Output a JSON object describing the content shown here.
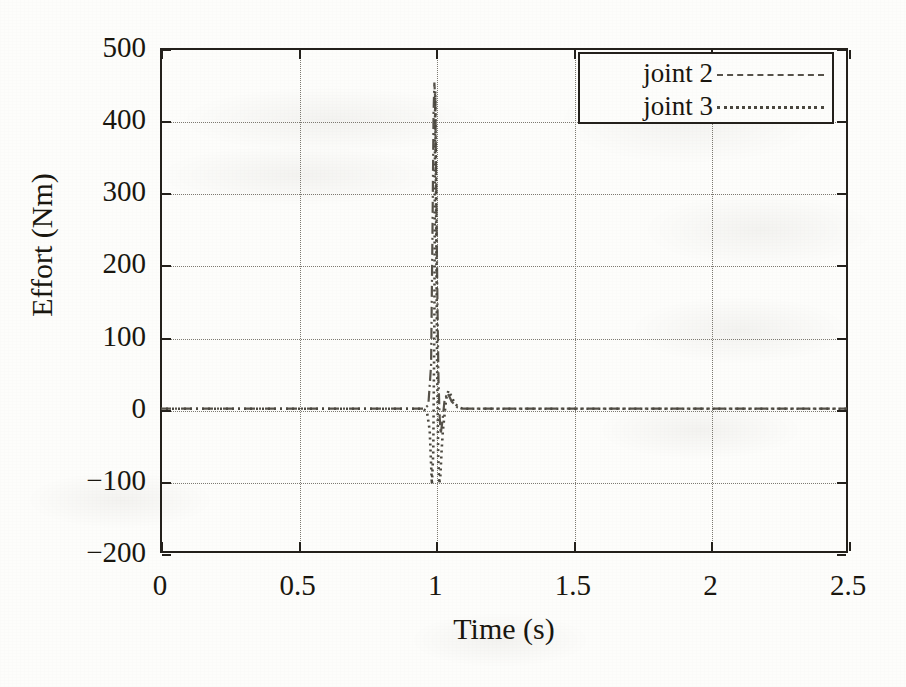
{
  "chart_data": {
    "type": "line",
    "title": "",
    "xlabel": "Time (s)",
    "ylabel": "Effort (Nm)",
    "xlim": [
      0,
      2.5
    ],
    "ylim": [
      -200,
      500
    ],
    "xticks": [
      "0",
      "0.5",
      "1",
      "1.5",
      "2",
      "2.5"
    ],
    "xtick_values": [
      0,
      0.5,
      1,
      1.5,
      2,
      2.5
    ],
    "yticks": [
      "500",
      "400",
      "300",
      "200",
      "100",
      "0",
      "-100",
      "-200"
    ],
    "ytick_values": [
      500,
      400,
      300,
      200,
      100,
      0,
      -100,
      -200
    ],
    "grid": true,
    "legend_position": "top-right",
    "series": [
      {
        "name": "joint 2",
        "style": "dash-dot",
        "color": "#56524a",
        "x": [
          0.0,
          0.1,
          0.2,
          0.3,
          0.4,
          0.5,
          0.6,
          0.7,
          0.8,
          0.9,
          0.96,
          0.975,
          0.985,
          0.99,
          0.994,
          0.997,
          1.0,
          1.004,
          1.008,
          1.012,
          1.016,
          1.02,
          1.026,
          1.034,
          1.045,
          1.06,
          1.08,
          1.1,
          1.2,
          1.4,
          1.6,
          1.8,
          2.0,
          2.2,
          2.5
        ],
        "y": [
          0,
          0,
          0,
          0,
          0,
          0,
          0,
          0,
          0,
          0,
          0,
          5,
          60,
          240,
          410,
          452,
          430,
          300,
          150,
          40,
          -10,
          -35,
          -18,
          12,
          22,
          10,
          2,
          0,
          0,
          0,
          0,
          0,
          0,
          0,
          0
        ]
      },
      {
        "name": "joint 3",
        "style": "dotted",
        "color": "#4a473f",
        "x": [
          0.0,
          0.1,
          0.2,
          0.3,
          0.4,
          0.5,
          0.6,
          0.7,
          0.8,
          0.9,
          0.955,
          0.97,
          0.98,
          0.988,
          0.993,
          0.997,
          1.0,
          1.003,
          1.007,
          1.011,
          1.015,
          1.019,
          1.023,
          1.028,
          1.034,
          1.04,
          1.048,
          1.058,
          1.07,
          1.085,
          1.1,
          1.2,
          1.4,
          1.6,
          1.8,
          2.0,
          2.2,
          2.5
        ],
        "y": [
          0,
          0,
          0,
          0,
          0,
          0,
          0,
          0,
          0,
          0,
          0,
          -4,
          -30,
          -105,
          -60,
          120,
          440,
          300,
          60,
          -70,
          -104,
          -92,
          -60,
          -30,
          -8,
          14,
          25,
          18,
          8,
          2,
          0,
          0,
          0,
          0,
          0,
          0,
          0,
          0
        ]
      }
    ],
    "annotations": [],
    "spike_time_s": 1.0,
    "peak_effort_nm": 452,
    "min_effort_nm": -105
  },
  "legend": {
    "entries": [
      {
        "label": "joint 2",
        "style": "dash-dot"
      },
      {
        "label": "joint 3",
        "style": "dotted"
      }
    ]
  },
  "axes": {
    "x_title": "Time (s)",
    "y_title": "Effort (Nm)"
  }
}
